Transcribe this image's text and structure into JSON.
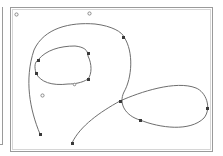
{
  "editor": {
    "title": "",
    "curve": {
      "stroke_color": "#6e6e6e",
      "node_color": "#3a3a3a",
      "handle_color": "#8a8a8a",
      "nodes": [
        {
          "id": "n1",
          "type": "anchor"
        },
        {
          "id": "n2",
          "type": "anchor"
        },
        {
          "id": "n3",
          "type": "anchor"
        },
        {
          "id": "n4",
          "type": "anchor"
        },
        {
          "id": "n5",
          "type": "anchor"
        },
        {
          "id": "n6",
          "type": "anchor"
        },
        {
          "id": "n7",
          "type": "anchor"
        },
        {
          "id": "n8",
          "type": "anchor"
        },
        {
          "id": "n9",
          "type": "anchor"
        },
        {
          "id": "n10",
          "type": "anchor"
        }
      ],
      "handles": [
        {
          "id": "h1",
          "type": "control"
        },
        {
          "id": "h2",
          "type": "control"
        },
        {
          "id": "h3",
          "type": "control"
        },
        {
          "id": "h4",
          "type": "control"
        }
      ]
    }
  }
}
